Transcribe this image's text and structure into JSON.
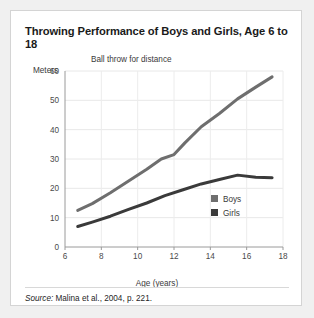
{
  "card": {
    "title": "Throwing Performance of Boys and Girls, Age 6 to 18",
    "source_prefix": "Source:",
    "source_text": " Malina et al., 2004, p. 221."
  },
  "chart_data": {
    "type": "line",
    "title": "Throwing Performance of Boys and Girls, Age 6 to 18",
    "subtitle": "Ball throw for distance",
    "xlabel": "Age (years)",
    "ylabel": "Meters",
    "xlim": [
      6,
      18
    ],
    "ylim": [
      0,
      60
    ],
    "xticks": [
      6,
      8,
      10,
      12,
      14,
      16,
      18
    ],
    "yticks": [
      0,
      10,
      20,
      30,
      40,
      50,
      60
    ],
    "grid": true,
    "legend_position": "inside-bottom-right",
    "series": [
      {
        "name": "Boys",
        "color": "#6e6e6e",
        "x": [
          6.7,
          7.5,
          8.5,
          9.5,
          10.5,
          11.3,
          12.0,
          12.6,
          13.5,
          14.5,
          15.5,
          16.5,
          17.4
        ],
        "values": [
          12.5,
          14.8,
          18.5,
          22.5,
          26.5,
          30.0,
          31.5,
          35.5,
          41.0,
          45.5,
          50.5,
          54.5,
          58.0
        ]
      },
      {
        "name": "Girls",
        "color": "#3a3a3a",
        "x": [
          6.7,
          7.5,
          8.5,
          9.5,
          10.5,
          11.5,
          12.5,
          13.5,
          14.5,
          15.5,
          16.5,
          17.4
        ],
        "values": [
          7.0,
          8.5,
          10.5,
          12.8,
          15.0,
          17.5,
          19.5,
          21.5,
          23.0,
          24.5,
          23.8,
          23.6
        ]
      }
    ],
    "legend": [
      {
        "label": "Boys",
        "color": "#6e6e6e"
      },
      {
        "label": "Girls",
        "color": "#3a3a3a"
      }
    ]
  }
}
